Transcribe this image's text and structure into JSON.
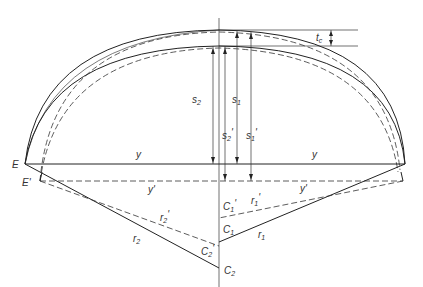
{
  "diagram": {
    "labels": {
      "E": "E",
      "E_prime": "E'",
      "y": "y",
      "y_prime": "y'",
      "s1": "s",
      "s1_sub": "1",
      "s2": "s",
      "s2_sub": "2",
      "s1_prime": "s",
      "s1_prime_sub": "1",
      "s2_prime": "s",
      "s2_prime_sub": "2",
      "tc": "t",
      "tc_sub": "c",
      "r1": "r",
      "r1_sub": "1",
      "r2": "r",
      "r2_sub": "2",
      "r1_prime": "r",
      "r1_prime_sub": "1",
      "r2_prime": "r",
      "r2_prime_sub": "2",
      "C1": "C",
      "C1_sub": "1",
      "C2": "C",
      "C2_sub": "2",
      "C1_prime": "C",
      "C1_prime_sub": "1",
      "C2_prime": "C",
      "C2_prime_sub": "2",
      "prime": "'"
    },
    "line_styles": {
      "solid": "original surfaces",
      "dashed": "shifted surfaces"
    }
  }
}
